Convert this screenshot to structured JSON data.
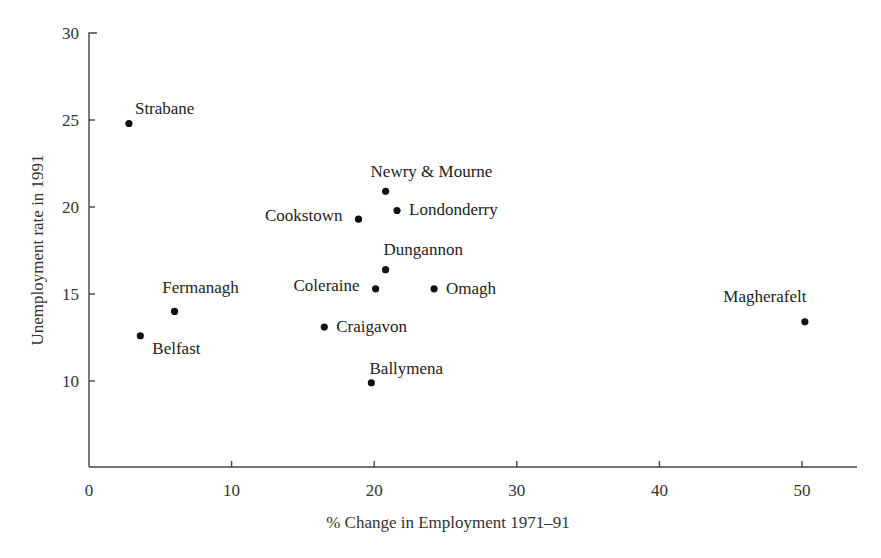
{
  "chart_data": {
    "type": "scatter",
    "title": "",
    "xlabel": "% Change in Employment 1971–91",
    "ylabel": "Unemployment rate in 1991",
    "xlim": [
      0,
      54
    ],
    "ylim": [
      5,
      30
    ],
    "xticks": [
      0,
      10,
      20,
      30,
      40,
      50
    ],
    "yticks": [
      10,
      15,
      20,
      25,
      30
    ],
    "grid": false,
    "legend": null,
    "points": [
      {
        "label": "Strabane",
        "x": 2.8,
        "y": 24.8,
        "label_pos": "above-right"
      },
      {
        "label": "Newry & Mourne",
        "x": 20.8,
        "y": 20.9,
        "label_pos": "above"
      },
      {
        "label": "Londonderry",
        "x": 21.6,
        "y": 19.8,
        "label_pos": "right"
      },
      {
        "label": "Cookstown",
        "x": 18.9,
        "y": 19.3,
        "label_pos": "left"
      },
      {
        "label": "Dungannon",
        "x": 20.8,
        "y": 16.4,
        "label_pos": "above"
      },
      {
        "label": "Coleraine",
        "x": 20.1,
        "y": 15.3,
        "label_pos": "left"
      },
      {
        "label": "Omagh",
        "x": 24.2,
        "y": 15.3,
        "label_pos": "right"
      },
      {
        "label": "Fermanagh",
        "x": 6.0,
        "y": 14.0,
        "label_pos": "above"
      },
      {
        "label": "Belfast",
        "x": 3.6,
        "y": 12.6,
        "label_pos": "below-right"
      },
      {
        "label": "Craigavon",
        "x": 16.5,
        "y": 13.1,
        "label_pos": "right"
      },
      {
        "label": "Ballymena",
        "x": 19.8,
        "y": 9.9,
        "label_pos": "above"
      },
      {
        "label": "Magherafelt",
        "x": 50.2,
        "y": 13.4,
        "label_pos": "above-left"
      }
    ]
  },
  "axes": {
    "x_title": "% Change in Employment 1971–91",
    "y_title": "Unemployment rate in 1991",
    "x_tick_labels": [
      "0",
      "10",
      "20",
      "30",
      "40",
      "50"
    ],
    "y_tick_labels": [
      "10",
      "15",
      "20",
      "25",
      "30"
    ]
  },
  "colors": {
    "axis": "#444444",
    "dot": "#111111",
    "text": "#222222",
    "background": "#ffffff"
  }
}
